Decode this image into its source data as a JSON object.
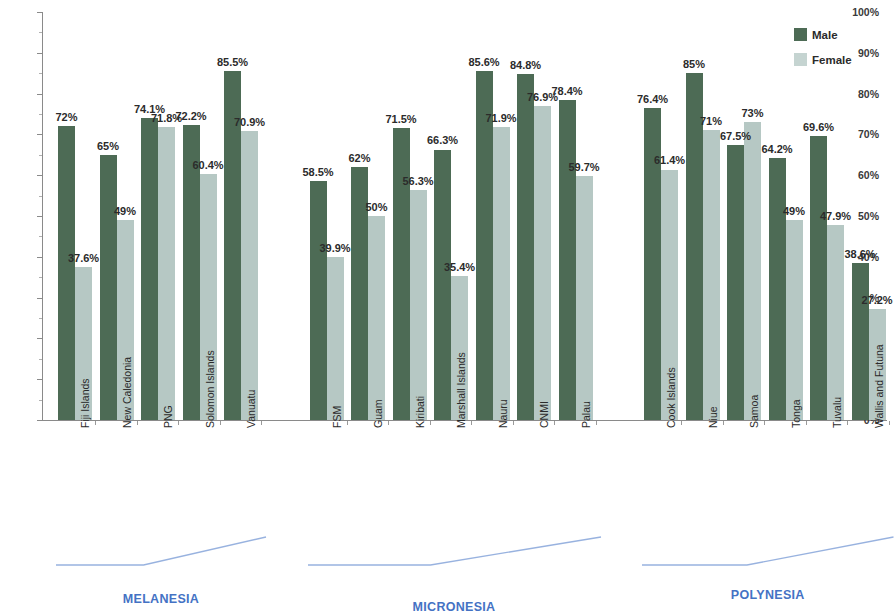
{
  "legend": {
    "items": [
      {
        "label": "Male",
        "color": "#4d6b55"
      },
      {
        "label": "Female",
        "color": "#c5d4d1"
      }
    ]
  },
  "regions": [
    {
      "name": "MELANESIA",
      "color": "#4472c4"
    },
    {
      "name": "MICRONESIA",
      "color": "#4472c4"
    },
    {
      "name": "POLYNESIA",
      "color": "#4472c4"
    }
  ],
  "chart_data": {
    "type": "bar",
    "title": "",
    "xlabel": "",
    "ylabel": "",
    "ylim": [
      0,
      100
    ],
    "ytick_labels": [
      "0%",
      "10%",
      "20%",
      "30%",
      "40%",
      "50%",
      "60%",
      "70%",
      "80%",
      "90%",
      "100%"
    ],
    "ytick_values": [
      0,
      10,
      20,
      30,
      40,
      50,
      60,
      70,
      80,
      90,
      100
    ],
    "grid": false,
    "legend_position": "top-right",
    "categories": [
      "Fiji Islands",
      "New Caledonia",
      "PNG",
      "Solomon Islands",
      "Vanuatu",
      "FSM",
      "Guam",
      "Kiribati",
      "Marshall Islands",
      "Nauru",
      "CNMI",
      "Palau",
      "Cook Islands",
      "Niue",
      "Samoa",
      "Tonga",
      "Tuvalu",
      "Wallis and Futuna"
    ],
    "groups": [
      {
        "name": "MELANESIA",
        "categories": [
          "Fiji Islands",
          "New Caledonia",
          "PNG",
          "Solomon Islands",
          "Vanuatu"
        ]
      },
      {
        "name": "MICRONESIA",
        "categories": [
          "FSM",
          "Guam",
          "Kiribati",
          "Marshall Islands",
          "Nauru",
          "CNMI",
          "Palau"
        ]
      },
      {
        "name": "POLYNESIA",
        "categories": [
          "Cook Islands",
          "Niue",
          "Samoa",
          "Tonga",
          "Tuvalu",
          "Wallis and Futuna"
        ]
      }
    ],
    "series": [
      {
        "name": "Male",
        "color": "#4d6b55",
        "values": [
          72,
          65,
          74.1,
          72.2,
          85.5,
          58.5,
          62,
          71.5,
          66.3,
          85.6,
          84.8,
          78.4,
          76.4,
          85,
          67.5,
          64.2,
          69.6,
          38.6
        ],
        "labels": [
          "72%",
          "65%",
          "74.1%",
          "72.2%",
          "85.5%",
          "58.5%",
          "62%",
          "71.5%",
          "66.3%",
          "85.6%",
          "84.8%",
          "78.4%",
          "76.4%",
          "85%",
          "67.5%",
          "64.2%",
          "69.6%",
          "38.6%"
        ]
      },
      {
        "name": "Female",
        "color": "#b6c8c4",
        "values": [
          37.6,
          49,
          71.8,
          60.4,
          70.9,
          39.9,
          50,
          56.3,
          35.4,
          71.9,
          76.9,
          59.7,
          61.4,
          71,
          73,
          49,
          47.9,
          27.2
        ],
        "labels": [
          "37.6%",
          "49%",
          "71.8%",
          "60.4%",
          "70.9%",
          "39.9%",
          "50%",
          "56.3%",
          "35.4%",
          "71.9%",
          "76.9%",
          "59.7%",
          "61.4%",
          "71%",
          "73%",
          "49%",
          "47.9%",
          "27.2%"
        ]
      }
    ]
  }
}
